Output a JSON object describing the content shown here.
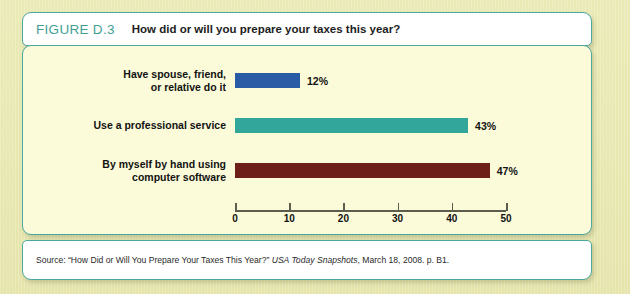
{
  "figure": {
    "number": "FIGURE D.3",
    "title": "How did or will you prepare your taxes this year?",
    "number_color": "#3f9f94",
    "border_color": "#4ba89c",
    "panel_background": "#fbfbd9",
    "page_background": "#e9e9b4"
  },
  "source": {
    "prefix": "Source: “How Did or Will You Prepare Your Taxes This Year?”",
    "publication": "USA Today Snapshots",
    "suffix": ", March 18, 2008. p. B1."
  },
  "chart_data": {
    "type": "bar",
    "orientation": "horizontal",
    "title": "How did or will you prepare your taxes this year?",
    "xlabel": "",
    "ylabel": "",
    "xlim": [
      0,
      50
    ],
    "xticks": [
      0,
      10,
      20,
      30,
      40,
      50
    ],
    "xtick_labels": [
      "0",
      "10",
      "20",
      "30",
      "40",
      "50"
    ],
    "grid": false,
    "legend": "none",
    "value_suffix": "%",
    "categories": [
      "Have spouse, friend,\nor relative do it",
      "Use a professional service",
      "By myself by hand using\ncomputer software"
    ],
    "values": [
      12,
      43,
      47
    ],
    "value_labels": [
      "12%",
      "43%",
      "47%"
    ],
    "colors": [
      "#2a5ca5",
      "#33a69b",
      "#6e2018"
    ],
    "bars": [
      {
        "label": "Have spouse, friend,\nor relative do it",
        "value": 12,
        "value_label": "12%",
        "color": "#2a5ca5"
      },
      {
        "label": "Use a professional service",
        "value": 43,
        "value_label": "43%",
        "color": "#33a69b"
      },
      {
        "label": "By myself by hand using\ncomputer software",
        "value": 47,
        "value_label": "47%",
        "color": "#6e2018"
      }
    ]
  }
}
